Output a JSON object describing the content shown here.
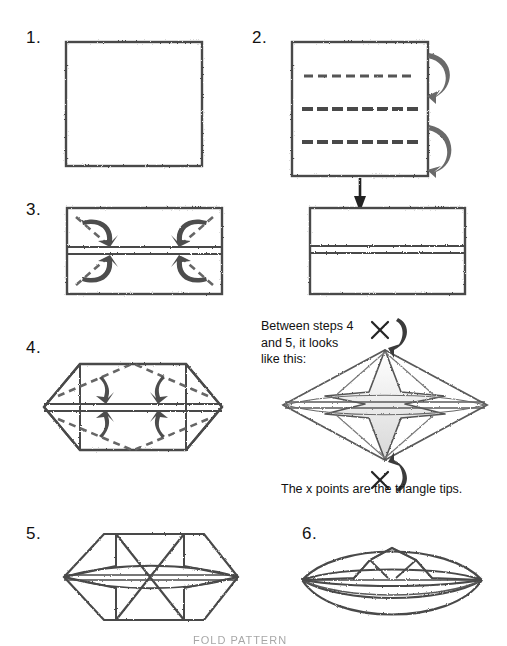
{
  "document": {
    "type": "origami-folding-instructions",
    "background_color": "#ffffff",
    "ink_color": "#333333",
    "width": 507,
    "height": 643
  },
  "steps": [
    {
      "id": "step-1",
      "number": "1.",
      "x": 26,
      "y": 28,
      "figure": "square-with-one-horizontal-dashed-fold-line",
      "description": "Square sheet with one horizontal dashed valley-fold line across the middle."
    },
    {
      "id": "step-2",
      "number": "2.",
      "x": 252,
      "y": 28,
      "figure": "square-with-three-dashed-lines-and-two-curved-fold-arrows",
      "description": "Square with three horizontal dashed lines and two curved fold arrows on the right edge."
    },
    {
      "id": "step-3",
      "number": "3.",
      "x": 26,
      "y": 200,
      "figure": "rectangle-with-four-corner-fold-arrows",
      "description": "Folded rectangle with four diagonal dashed lines and curved corner-fold arrows."
    },
    {
      "id": "step-4",
      "number": "4.",
      "x": 26,
      "y": 338,
      "figure": "hexagon-with-four-inward-fold-arrows",
      "description": "Hexagonal shape with four dashed diagonal creases and inward pointing arrows."
    },
    {
      "id": "step-5",
      "number": "5.",
      "x": 26,
      "y": 524,
      "figure": "hexagon-with-two-triangle-tips",
      "description": "Flattened hexagon showing two opposed triangle points meeting at the centre."
    },
    {
      "id": "step-6",
      "number": "6.",
      "x": 302,
      "y": 524,
      "figure": "finished-boat-shape",
      "description": "Finished boat / canoe shape with peaked sail folds."
    }
  ],
  "result_figure": {
    "id": "step-2-result",
    "figure": "wide-rectangle-with-center-band",
    "description": "Result of step 2: wide rectangle with a horizontal band through the centre."
  },
  "annotations": {
    "between_steps_note": "Between steps 4\nand 5, it looks\nlike this:",
    "x_points_caption": "The x points are the triangle tips.",
    "x_mark_top": "×",
    "x_mark_bottom": "×",
    "middle_figure": {
      "id": "between-4-and-5-figure",
      "figure": "four-pointed-star-diamond",
      "description": "Diamond shaped model with a four pointed star formed by the raised triangle tips."
    }
  },
  "footer": {
    "text": "FOLD PATTERN"
  }
}
